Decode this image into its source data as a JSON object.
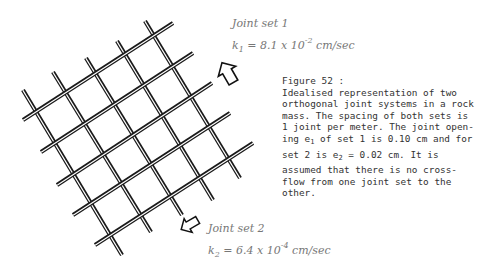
{
  "figure": {
    "number_label": "Figure 52 :",
    "caption_lines": [
      "Idealised representation of two",
      "orthogonal joint systems in a rock",
      "mass. The spacing of both sets is",
      "1 joint per meter.  The joint open-"
    ],
    "caption_line5_pre": "ing e",
    "caption_line5_sub": "1",
    "caption_line5_post": " of set 1 is 0.10 cm and for",
    "caption_line6_pre": "set 2 is e",
    "caption_line6_sub": "2",
    "caption_line6_post": " = 0.02 cm.  It is",
    "caption_tail": [
      "assumed that there is no cross-",
      "flow from one joint set to the",
      "other."
    ]
  },
  "joint_set_1": {
    "title": "Joint set 1",
    "k_symbol": "k",
    "k_sub": "1",
    "k_value": " = 8.1 x 10",
    "k_exp": "-2",
    "k_unit": " cm/sec",
    "arrow_direction": "up-left"
  },
  "joint_set_2": {
    "title": "Joint set 2",
    "k_symbol": "k",
    "k_sub": "2",
    "k_value": " = 6.4 x 10",
    "k_exp": "-4",
    "k_unit": " cm/sec",
    "arrow_direction": "down-left"
  },
  "grid": {
    "line_color": "#1a1a1a",
    "down_right_lines": [
      [
        23,
        90,
        122,
        255
      ],
      [
        53,
        72,
        151,
        232
      ],
      [
        86,
        58,
        182,
        215
      ],
      [
        117,
        41,
        213,
        200
      ],
      [
        145,
        21,
        240,
        178
      ]
    ],
    "up_right_lines": [
      [
        23,
        120,
        173,
        23
      ],
      [
        41,
        152,
        193,
        53
      ],
      [
        57,
        185,
        212,
        83
      ],
      [
        73,
        215,
        230,
        113
      ],
      [
        95,
        245,
        253,
        143
      ]
    ]
  }
}
